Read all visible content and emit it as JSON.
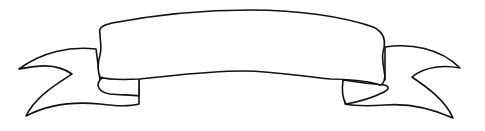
{
  "illustration": {
    "subject": "ribbon-banner",
    "text": "",
    "colors": {
      "stroke": "#111111",
      "fill": "#ffffff",
      "background": "#ffffff"
    }
  }
}
